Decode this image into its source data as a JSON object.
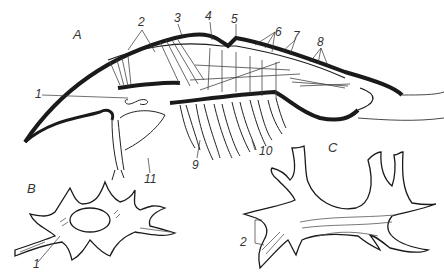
{
  "figure": {
    "panels": [
      {
        "id": "A",
        "label": "A"
      },
      {
        "id": "B",
        "label": "B"
      },
      {
        "id": "C",
        "label": "C"
      }
    ],
    "labels_A": {
      "l1": "1",
      "l2": "2",
      "l3": "3",
      "l4": "4",
      "l5": "5",
      "l6": "6",
      "l7": "7",
      "l8": "8",
      "l9": "9",
      "l10": "10",
      "l11": "11"
    },
    "labels_B": {
      "l1": "1"
    },
    "labels_C": {
      "l2": "2"
    },
    "colors": {
      "ink": "#1a1a1a",
      "shade": "#555555",
      "background": "#ffffff"
    }
  }
}
